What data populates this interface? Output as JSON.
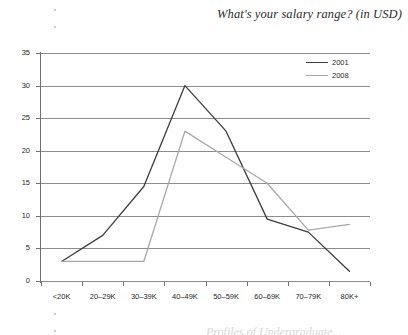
{
  "chart_title": "What's your salary range? (in USD)",
  "footer_clipped_text": "Profiles of Undergraduate...",
  "legend": {
    "position": "top-right",
    "entries": [
      {
        "label": "2001",
        "color": "#3d3d3d"
      },
      {
        "label": "2008",
        "color": "#a8a8a8"
      }
    ]
  },
  "axes": {
    "y_ticks": [
      "0",
      "5",
      "10",
      "15",
      "20",
      "25",
      "30",
      "35"
    ],
    "x_labels": [
      "<20K",
      "20–29K",
      "30–39K",
      "40–49K",
      "50–59K",
      "60–69K",
      "70–79K",
      "80K+"
    ]
  },
  "chart_data": {
    "type": "line",
    "title": "What's your salary range? (in USD)",
    "xlabel": "",
    "ylabel": "",
    "ylim": [
      0,
      35
    ],
    "ytick_step": 5,
    "grid": true,
    "legend_position": "top-right",
    "categories": [
      "<20K",
      "20–29K",
      "30–39K",
      "40–49K",
      "50–59K",
      "60–69K",
      "70–79K",
      "80K+"
    ],
    "series": [
      {
        "name": "2001",
        "color": "#3d3d3d",
        "values": [
          3,
          7,
          14.5,
          30,
          23,
          9.5,
          7.5,
          1.5
        ]
      },
      {
        "name": "2008",
        "color": "#a8a8a8",
        "values": [
          3,
          3,
          3,
          23,
          19,
          15,
          7.8,
          8.7
        ]
      }
    ]
  }
}
